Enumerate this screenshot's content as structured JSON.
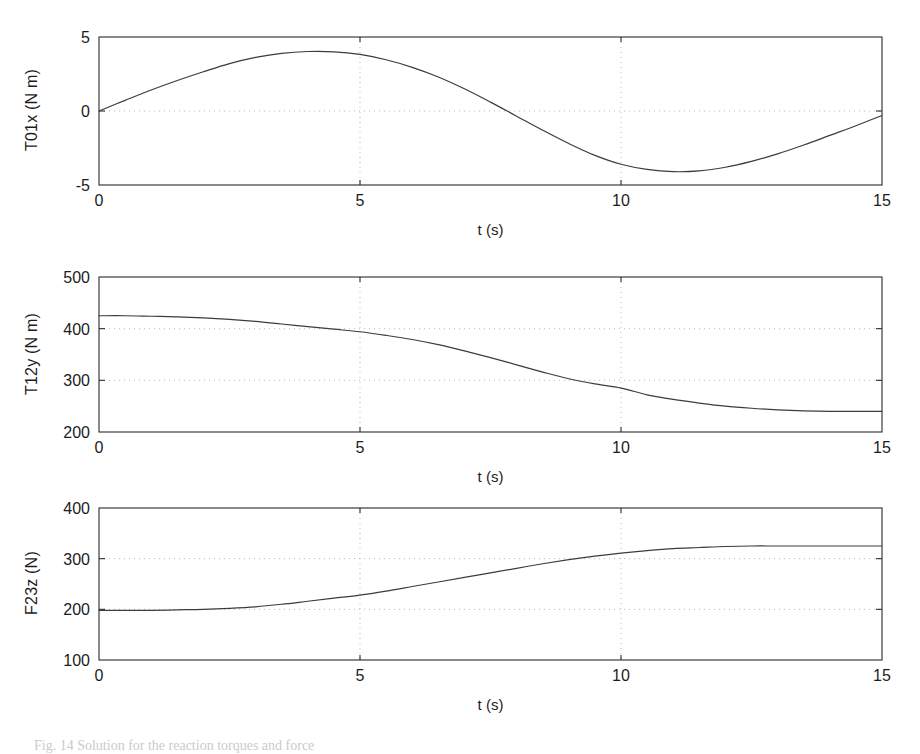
{
  "figure": {
    "caption": "Fig. 14  Solution for the reaction torques and force",
    "background": "#ffffff",
    "line_color": "#3c3c3c",
    "axis_color": "#2b2b2b",
    "grid_color": "#b9b9b9"
  },
  "panels": [
    {
      "id": "panel-t01x",
      "ylabel": "T01x (N m)",
      "xlabel": "t (s)"
    },
    {
      "id": "panel-t12y",
      "ylabel": "T12y (N m)",
      "xlabel": "t (s)"
    },
    {
      "id": "panel-f23z",
      "ylabel": "F23z (N)",
      "xlabel": "t (s)"
    }
  ],
  "chart_data": [
    {
      "type": "line",
      "title": "",
      "xlabel": "t (s)",
      "ylabel": "T01x (N m)",
      "xlim": [
        0,
        15
      ],
      "ylim": [
        -5,
        5
      ],
      "xticks": [
        0,
        5,
        10,
        15
      ],
      "xtick_labels": [
        "0",
        "5",
        "10",
        "15"
      ],
      "yticks": [
        -5,
        0,
        5
      ],
      "ytick_labels": [
        "-5",
        "0",
        "5"
      ],
      "grid": true,
      "gridlines_x": [
        5,
        10
      ],
      "gridlines_y": [
        0
      ],
      "legend": null,
      "x": [
        0,
        0.5,
        1,
        1.5,
        2,
        2.5,
        3,
        3.5,
        4,
        4.5,
        5,
        5.5,
        6,
        6.5,
        7,
        7.5,
        8,
        8.5,
        9,
        9.5,
        10,
        10.5,
        11,
        11.5,
        12,
        12.5,
        13,
        13.5,
        14,
        14.5,
        15
      ],
      "y": [
        0.0,
        0.72,
        1.42,
        2.06,
        2.65,
        3.2,
        3.62,
        3.9,
        4.02,
        4.0,
        3.82,
        3.46,
        2.95,
        2.3,
        1.5,
        0.6,
        -0.35,
        -1.3,
        -2.2,
        -3.0,
        -3.6,
        -3.95,
        -4.1,
        -4.05,
        -3.8,
        -3.4,
        -2.9,
        -2.3,
        -1.65,
        -1.0,
        -0.3
      ]
    },
    {
      "type": "line",
      "title": "",
      "xlabel": "t (s)",
      "ylabel": "T12y (N m)",
      "xlim": [
        0,
        15
      ],
      "ylim": [
        200,
        500
      ],
      "xticks": [
        0,
        5,
        10,
        15
      ],
      "xtick_labels": [
        "0",
        "5",
        "10",
        "15"
      ],
      "yticks": [
        200,
        300,
        400,
        500
      ],
      "ytick_labels": [
        "200",
        "300",
        "400",
        "500"
      ],
      "grid": true,
      "gridlines_x": [
        5,
        10
      ],
      "gridlines_y": [
        300,
        400
      ],
      "legend": null,
      "x": [
        0,
        0.5,
        1,
        1.5,
        2,
        2.5,
        3,
        3.5,
        4,
        4.5,
        5,
        5.5,
        6,
        6.5,
        7,
        7.5,
        8,
        8.5,
        9,
        9.5,
        10,
        10.5,
        11,
        11.5,
        12,
        12.5,
        13,
        13.5,
        14,
        14.5,
        15
      ],
      "y": [
        425,
        425,
        424,
        423,
        421,
        418,
        414,
        409,
        404,
        399,
        394,
        387,
        379,
        369,
        357,
        344,
        330,
        316,
        303,
        293,
        285,
        272,
        263,
        256,
        250,
        246,
        243,
        241,
        240,
        240,
        240
      ]
    },
    {
      "type": "line",
      "title": "",
      "xlabel": "t (s)",
      "ylabel": "F23z (N)",
      "xlim": [
        0,
        15
      ],
      "ylim": [
        100,
        400
      ],
      "xticks": [
        0,
        5,
        10,
        15
      ],
      "xtick_labels": [
        "0",
        "5",
        "10",
        "15"
      ],
      "yticks": [
        100,
        200,
        300,
        400
      ],
      "ytick_labels": [
        "100",
        "200",
        "300",
        "400"
      ],
      "grid": true,
      "gridlines_x": [
        5,
        10
      ],
      "gridlines_y": [
        200,
        300
      ],
      "legend": null,
      "x": [
        0,
        0.5,
        1,
        1.5,
        2,
        2.5,
        3,
        3.5,
        4,
        4.5,
        5,
        5.5,
        6,
        6.5,
        7,
        7.5,
        8,
        8.5,
        9,
        9.5,
        10,
        10.5,
        11,
        11.5,
        12,
        12.5,
        13,
        13.5,
        14,
        14.5,
        15
      ],
      "y": [
        198,
        198,
        198,
        199,
        200,
        202,
        205,
        210,
        216,
        222,
        228,
        236,
        245,
        254,
        263,
        272,
        281,
        290,
        298,
        305,
        311,
        316,
        320,
        322,
        324,
        325,
        325,
        325,
        325,
        325,
        325
      ]
    }
  ]
}
